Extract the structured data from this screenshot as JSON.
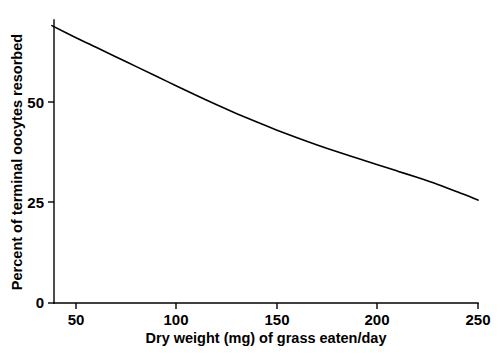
{
  "chart_data": {
    "type": "line",
    "title": "",
    "subtitle": "",
    "xlabel": "Dry weight (mg) of grass eaten/day",
    "ylabel": "Percent of terminal oocytes resorbed",
    "xlim": [
      38,
      250
    ],
    "ylim": [
      0,
      72
    ],
    "xticks": [
      50,
      100,
      150,
      200,
      250
    ],
    "xticklabels": [
      "50",
      "100",
      "150",
      "200",
      "250"
    ],
    "yticks": [
      0,
      25,
      50
    ],
    "yticklabels": [
      "0",
      "25",
      "50"
    ],
    "grid": false,
    "legend": null,
    "legend_position": "none",
    "annotations": [],
    "series": [
      {
        "name": "Percent of terminal oocytes resorbed",
        "color": "#000000",
        "x": [
          38,
          50,
          60,
          70,
          80,
          90,
          100,
          110,
          120,
          130,
          140,
          150,
          160,
          170,
          180,
          190,
          200,
          210,
          220,
          230,
          240,
          250
        ],
        "y": [
          69.0,
          66.0,
          63.6,
          61.2,
          58.8,
          56.4,
          54.0,
          51.6,
          49.3,
          47.1,
          45.0,
          43.0,
          41.1,
          39.3,
          37.6,
          36.0,
          34.4,
          32.8,
          31.2,
          29.5,
          27.6,
          25.6
        ]
      }
    ]
  },
  "axis": {
    "x_tick_labels": [
      "50",
      "100",
      "150",
      "200",
      "250"
    ],
    "y_tick_labels": [
      "0",
      "25",
      "50"
    ],
    "x_title": "Dry weight (mg) of grass eaten/day",
    "y_title": "Percent of terminal oocytes resorbed"
  },
  "colors": {
    "curve": "#000000",
    "axis": "#000000",
    "background": "#ffffff"
  }
}
